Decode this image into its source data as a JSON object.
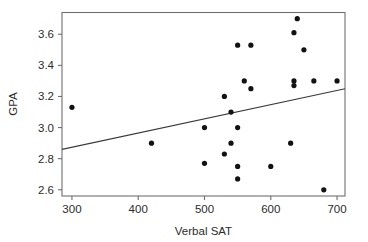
{
  "chart_data": {
    "type": "scatter",
    "title": "",
    "xlabel": "Verbal SAT",
    "ylabel": "GPA",
    "xlim": [
      285,
      712
    ],
    "ylim": [
      2.56,
      3.74
    ],
    "grid": false,
    "legend": null,
    "xticks": [
      300,
      400,
      500,
      600,
      700
    ],
    "xticklabels": [
      "300",
      "400",
      "500",
      "600",
      "700"
    ],
    "yticks": [
      2.6,
      2.8,
      3.0,
      3.2,
      3.4,
      3.6
    ],
    "yticklabels": [
      "2.6",
      "2.8",
      "3.0",
      "3.2",
      "3.4",
      "3.6"
    ],
    "series": [
      {
        "name": "students",
        "marker": "filled-circle",
        "color": "#121212",
        "points": [
          {
            "x": 300,
            "y": 3.13
          },
          {
            "x": 420,
            "y": 2.9
          },
          {
            "x": 500,
            "y": 3.0
          },
          {
            "x": 500,
            "y": 2.77
          },
          {
            "x": 530,
            "y": 3.2
          },
          {
            "x": 530,
            "y": 2.83
          },
          {
            "x": 540,
            "y": 3.1
          },
          {
            "x": 540,
            "y": 2.9
          },
          {
            "x": 550,
            "y": 3.53
          },
          {
            "x": 550,
            "y": 3.0
          },
          {
            "x": 550,
            "y": 2.75
          },
          {
            "x": 550,
            "y": 2.67
          },
          {
            "x": 560,
            "y": 3.3
          },
          {
            "x": 570,
            "y": 3.53
          },
          {
            "x": 570,
            "y": 3.25
          },
          {
            "x": 600,
            "y": 2.75
          },
          {
            "x": 630,
            "y": 2.9
          },
          {
            "x": 635,
            "y": 3.61
          },
          {
            "x": 635,
            "y": 3.3
          },
          {
            "x": 635,
            "y": 3.27
          },
          {
            "x": 640,
            "y": 3.7
          },
          {
            "x": 650,
            "y": 3.5
          },
          {
            "x": 665,
            "y": 3.3
          },
          {
            "x": 680,
            "y": 2.6
          },
          {
            "x": 700,
            "y": 3.3
          }
        ]
      }
    ],
    "fit_line": {
      "name": "regression-line",
      "color": "#3a3a3a",
      "x_start": 285,
      "y_start": 2.86,
      "x_end": 712,
      "y_end": 3.25
    }
  },
  "axes": {
    "x_title": "Verbal SAT",
    "y_title": "GPA"
  }
}
